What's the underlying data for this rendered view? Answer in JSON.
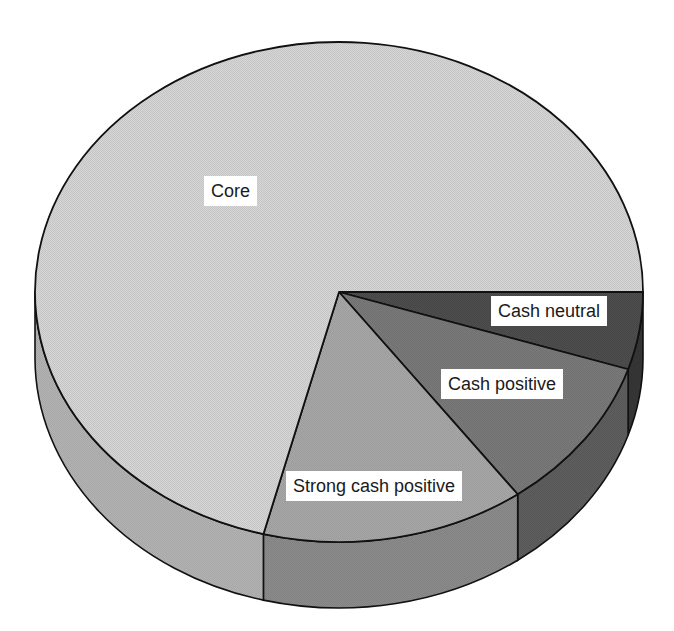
{
  "chart_data": {
    "type": "pie",
    "style": "3d-exploded-none",
    "title": "",
    "categories": [
      "Core",
      "Strong cash positive",
      "Cash positive",
      "Cash neutral"
    ],
    "values": [
      71,
      14,
      10,
      5
    ],
    "value_unit": "% (estimated from slice angles)",
    "colors": [
      "#d6d6d6",
      "#a8a8a8",
      "#7a7a7a",
      "#4d4d4d"
    ],
    "side_colors": [
      "#b4b4b4",
      "#8c8c8c",
      "#5e5e5e",
      "#363636"
    ],
    "legend": "none (labels placed on slices)",
    "labels": [
      {
        "text": "Core",
        "left": 204,
        "top": 176
      },
      {
        "text": "Strong cash positive",
        "left": 286,
        "top": 471
      },
      {
        "text": "Cash positive",
        "left": 441,
        "top": 369
      },
      {
        "text": "Cash neutral",
        "left": 491,
        "top": 296
      }
    ]
  }
}
